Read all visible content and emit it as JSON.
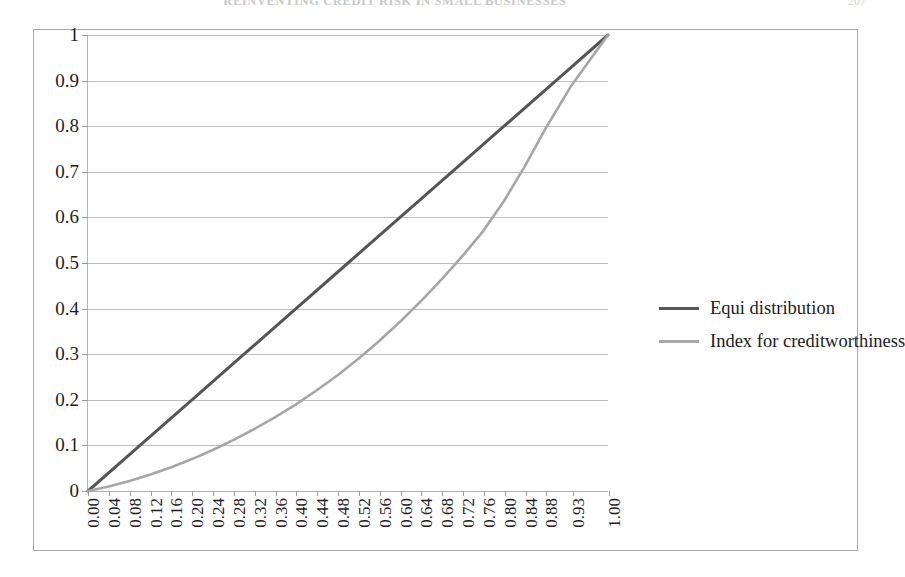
{
  "page": {
    "header_title": "REINVENTING CREDIT RISK IN SMALL BUSINESSES",
    "folio": "207"
  },
  "chart_data": {
    "type": "line",
    "title": "",
    "subtitle": "",
    "xlabel": "",
    "ylabel": "",
    "xlim": [
      0.0,
      1.0
    ],
    "ylim": [
      0.0,
      1.0
    ],
    "grid": true,
    "legend_position": "right",
    "y_ticks": [
      "0",
      "0.1",
      "0.2",
      "0.3",
      "0.4",
      "0.5",
      "0.6",
      "0.7",
      "0.8",
      "0.9",
      "1"
    ],
    "y_tick_values": [
      0,
      0.1,
      0.2,
      0.3,
      0.4,
      0.5,
      0.6,
      0.7,
      0.8,
      0.9,
      1
    ],
    "x_tick_labels": [
      "0.00",
      "0.04",
      "0.08",
      "0.12",
      "0.16",
      "0.20",
      "0.24",
      "0.28",
      "0.32",
      "0.36",
      "0.40",
      "0.44",
      "0.48",
      "0.52",
      "0.56",
      "0.60",
      "0.64",
      "0.68",
      "0.72",
      "0.76",
      "0.80",
      "0.84",
      "0.88",
      "0.93",
      "1.00"
    ],
    "x_tick_values": [
      0.0,
      0.04,
      0.08,
      0.12,
      0.16,
      0.2,
      0.24,
      0.28,
      0.32,
      0.36,
      0.4,
      0.44,
      0.48,
      0.52,
      0.56,
      0.6,
      0.64,
      0.68,
      0.72,
      0.76,
      0.8,
      0.84,
      0.88,
      0.93,
      1.0
    ],
    "series": [
      {
        "name": "Equi distribution",
        "color": "#555555",
        "width": 3.0,
        "x": [
          0.0,
          0.1,
          0.2,
          0.3,
          0.4,
          0.5,
          0.6,
          0.7,
          0.8,
          0.9,
          1.0
        ],
        "values": [
          0.0,
          0.1,
          0.2,
          0.3,
          0.4,
          0.5,
          0.6,
          0.7,
          0.8,
          0.9,
          1.0
        ]
      },
      {
        "name": "Index for creditworthiness",
        "color": "#a6a6a6",
        "width": 2.6,
        "x": [
          0.0,
          0.04,
          0.08,
          0.12,
          0.16,
          0.2,
          0.24,
          0.28,
          0.32,
          0.36,
          0.4,
          0.44,
          0.48,
          0.52,
          0.56,
          0.6,
          0.64,
          0.68,
          0.72,
          0.76,
          0.8,
          0.84,
          0.88,
          0.93,
          1.0
        ],
        "values": [
          0.0,
          0.01,
          0.022,
          0.036,
          0.052,
          0.07,
          0.09,
          0.112,
          0.136,
          0.162,
          0.19,
          0.221,
          0.254,
          0.29,
          0.329,
          0.371,
          0.416,
          0.464,
          0.515,
          0.57,
          0.636,
          0.712,
          0.795,
          0.89,
          1.0
        ]
      }
    ]
  },
  "legend": {
    "items": [
      {
        "label": "Equi distribution",
        "color": "#555555"
      },
      {
        "label": "Index for creditworthiness",
        "color": "#a6a6a6"
      }
    ]
  }
}
